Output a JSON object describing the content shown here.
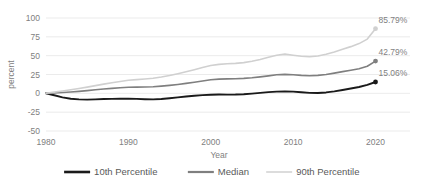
{
  "chart_data": {
    "type": "line",
    "title": "",
    "xlabel": "Year",
    "ylabel": "percent",
    "xlim": [
      1980,
      2022
    ],
    "ylim": [
      -50,
      100
    ],
    "grid": true,
    "legend_position": "bottom",
    "xticks": [
      "1980",
      "1990",
      "2000",
      "2010",
      "2020"
    ],
    "xtick_values": [
      1980,
      1990,
      2000,
      2010,
      2020
    ],
    "yticks": [
      "100",
      "75",
      "50",
      "25",
      "0",
      "-25",
      "-50"
    ],
    "ytick_values": [
      100,
      75,
      50,
      25,
      0,
      -25,
      -50
    ],
    "x": [
      1980,
      1981,
      1982,
      1983,
      1984,
      1985,
      1986,
      1987,
      1988,
      1989,
      1990,
      1991,
      1992,
      1993,
      1994,
      1995,
      1996,
      1997,
      1998,
      1999,
      2000,
      2001,
      2002,
      2003,
      2004,
      2005,
      2006,
      2007,
      2008,
      2009,
      2010,
      2011,
      2012,
      2013,
      2014,
      2015,
      2016,
      2017,
      2018,
      2019,
      2020
    ],
    "series": [
      {
        "name": "10th Percentile",
        "color": "#1a1a1a",
        "width": 1.9,
        "end_label": "15.06%",
        "end_value": 15.06,
        "values": [
          0.0,
          -2.6,
          -5.4,
          -7.2,
          -8.0,
          -8.3,
          -8.0,
          -7.6,
          -7.4,
          -7.1,
          -7.0,
          -7.4,
          -7.8,
          -8.0,
          -7.6,
          -6.6,
          -5.4,
          -4.2,
          -3.2,
          -2.4,
          -1.8,
          -1.6,
          -1.7,
          -1.6,
          -1.2,
          -0.4,
          0.6,
          1.6,
          2.3,
          2.6,
          2.3,
          1.4,
          0.6,
          0.4,
          1.2,
          2.6,
          4.4,
          6.4,
          8.4,
          11.2,
          15.06
        ]
      },
      {
        "name": "Median",
        "color": "#7f7f7f",
        "width": 1.6,
        "end_label": "42.79%",
        "end_value": 42.79,
        "values": [
          0.0,
          0.6,
          1.2,
          1.8,
          2.6,
          3.6,
          4.8,
          5.8,
          6.6,
          7.4,
          8.0,
          8.2,
          8.4,
          8.8,
          9.6,
          10.6,
          11.8,
          13.2,
          14.8,
          16.4,
          18.0,
          18.8,
          19.2,
          19.4,
          19.8,
          20.6,
          21.8,
          23.2,
          24.6,
          25.2,
          24.6,
          23.8,
          23.4,
          23.8,
          25.0,
          26.8,
          28.8,
          30.6,
          32.6,
          36.0,
          42.79
        ]
      },
      {
        "name": "90th Percentile",
        "color": "#d0d0d0",
        "width": 1.6,
        "end_label": "85.79%",
        "end_value": 85.79,
        "values": [
          0.0,
          1.6,
          3.2,
          4.8,
          6.4,
          8.2,
          10.2,
          12.2,
          14.0,
          15.8,
          17.4,
          18.2,
          19.0,
          20.0,
          21.6,
          23.6,
          26.0,
          28.6,
          31.4,
          34.2,
          37.0,
          38.4,
          39.2,
          39.8,
          40.8,
          42.6,
          45.0,
          47.8,
          50.6,
          52.0,
          50.6,
          49.2,
          48.6,
          49.6,
          51.8,
          54.8,
          58.4,
          62.0,
          66.0,
          72.0,
          85.79
        ]
      }
    ]
  },
  "legend": {
    "items": [
      {
        "label": "10th Percentile",
        "color": "#1a1a1a",
        "width": 2.6
      },
      {
        "label": "Median",
        "color": "#7f7f7f",
        "width": 2.2
      },
      {
        "label": "90th Percentile",
        "color": "#d9d9d9",
        "width": 1.8
      }
    ]
  },
  "axis": {
    "x_title": "Year",
    "y_title": "percent"
  }
}
